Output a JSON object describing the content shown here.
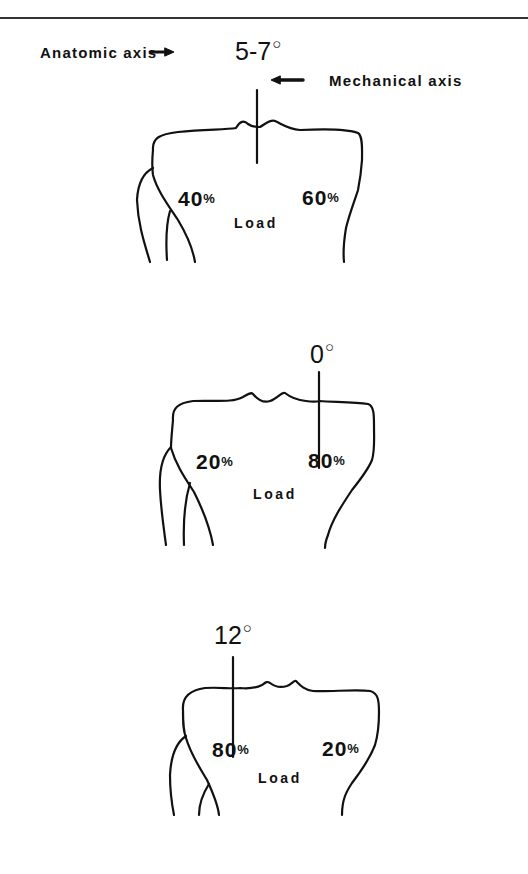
{
  "figure": {
    "panels": [
      {
        "id": "normal",
        "angle_label": "5-7",
        "degree_symbol": "○",
        "anatomic_axis_label": "Anatomic axis",
        "mechanical_axis_label": "Mechanical axis",
        "medial_load_value": "40",
        "lateral_load_value": "60",
        "percent_symbol": "%",
        "load_label": "Load"
      },
      {
        "id": "varus",
        "angle_label": "0",
        "degree_symbol": "○",
        "medial_load_value": "20",
        "lateral_load_value": "80",
        "percent_symbol": "%",
        "load_label": "Load"
      },
      {
        "id": "valgus",
        "angle_label": "12",
        "degree_symbol": "○",
        "medial_load_value": "80",
        "lateral_load_value": "20",
        "percent_symbol": "%",
        "load_label": "Load"
      }
    ]
  }
}
